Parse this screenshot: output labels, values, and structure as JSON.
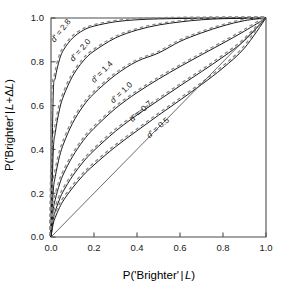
{
  "chart_data": {
    "type": "line",
    "title": "",
    "xlabel": "P('Brighter' | L)",
    "ylabel": "P('Brighter' | L+ΔL)",
    "xlim": [
      0.0,
      1.0
    ],
    "ylim": [
      0.0,
      1.0
    ],
    "grid": false,
    "legend_position": "inline-curve-labels",
    "xticks": [
      "0.0",
      "0.2",
      "0.4",
      "0.6",
      "0.8",
      "1.0"
    ],
    "xtick_values": [
      0.0,
      0.2,
      0.4,
      0.6,
      0.8,
      1.0
    ],
    "yticks": [
      "0.0",
      "0.2",
      "0.4",
      "0.6",
      "0.8",
      "1.0"
    ],
    "ytick_values": [
      0.0,
      0.2,
      0.4,
      0.6,
      0.8,
      1.0
    ],
    "series": [
      {
        "name": "d' = 2.8",
        "dprime": 2.8,
        "label": "d' = 2.8",
        "label_x": 0.055,
        "label_y": 0.935,
        "label_rotation": -52,
        "style": "solid-with-dashed-overlay",
        "x": [
          0.0,
          0.01,
          0.02,
          0.04,
          0.06,
          0.1,
          0.15,
          0.2,
          0.3,
          0.4,
          0.5,
          0.6,
          0.7,
          0.8,
          0.9,
          1.0
        ],
        "y": [
          0.0,
          0.636,
          0.727,
          0.812,
          0.857,
          0.908,
          0.944,
          0.963,
          0.983,
          0.992,
          0.996,
          0.998,
          0.999,
          1.0,
          1.0,
          1.0
        ]
      },
      {
        "name": "d' = 2.0",
        "dprime": 2.0,
        "label": "d' = 2.0",
        "label_x": 0.145,
        "label_y": 0.845,
        "label_rotation": -48,
        "style": "solid-with-dashed-overlay",
        "x": [
          0.0,
          0.01,
          0.02,
          0.04,
          0.06,
          0.1,
          0.15,
          0.2,
          0.3,
          0.4,
          0.5,
          0.6,
          0.7,
          0.8,
          0.9,
          1.0
        ],
        "y": [
          0.0,
          0.379,
          0.477,
          0.584,
          0.648,
          0.734,
          0.804,
          0.849,
          0.909,
          0.945,
          0.968,
          0.982,
          0.992,
          0.997,
          0.999,
          1.0
        ]
      },
      {
        "name": "d' = 1.4",
        "dprime": 1.4,
        "label": "d' = 1.4",
        "label_x": 0.245,
        "label_y": 0.745,
        "label_rotation": -45,
        "style": "solid-with-dashed-overlay",
        "x": [
          0.0,
          0.01,
          0.02,
          0.04,
          0.06,
          0.1,
          0.15,
          0.2,
          0.3,
          0.4,
          0.5,
          0.6,
          0.7,
          0.8,
          0.9,
          1.0
        ],
        "y": [
          0.0,
          0.204,
          0.277,
          0.369,
          0.43,
          0.519,
          0.598,
          0.655,
          0.74,
          0.802,
          0.84,
          0.893,
          0.932,
          0.964,
          0.988,
          1.0
        ]
      },
      {
        "name": "d' = 1.0",
        "dprime": 1.0,
        "label": "d' = 1.0",
        "label_x": 0.335,
        "label_y": 0.65,
        "label_rotation": -43,
        "style": "solid-with-dashed-overlay",
        "x": [
          0.0,
          0.01,
          0.02,
          0.04,
          0.06,
          0.1,
          0.15,
          0.2,
          0.3,
          0.4,
          0.5,
          0.6,
          0.7,
          0.8,
          0.9,
          1.0
        ],
        "y": [
          0.0,
          0.12,
          0.172,
          0.242,
          0.292,
          0.367,
          0.44,
          0.496,
          0.587,
          0.659,
          0.721,
          0.778,
          0.832,
          0.885,
          0.94,
          1.0
        ]
      },
      {
        "name": "d' = 0.7",
        "dprime": 0.7,
        "label": "d' = 0.7",
        "label_x": 0.425,
        "label_y": 0.565,
        "label_rotation": -42,
        "style": "solid-with-dashed-overlay",
        "x": [
          0.0,
          0.01,
          0.02,
          0.04,
          0.06,
          0.1,
          0.15,
          0.2,
          0.3,
          0.4,
          0.5,
          0.6,
          0.7,
          0.8,
          0.9,
          1.0
        ],
        "y": [
          0.0,
          0.079,
          0.118,
          0.173,
          0.214,
          0.278,
          0.343,
          0.395,
          0.483,
          0.557,
          0.624,
          0.69,
          0.755,
          0.822,
          0.897,
          1.0
        ]
      },
      {
        "name": "d' = 0.5",
        "dprime": 0.5,
        "label": "d' = 0.5",
        "label_x": 0.505,
        "label_y": 0.49,
        "label_rotation": -41,
        "style": "solid-with-dashed-overlay",
        "x": [
          0.0,
          0.01,
          0.02,
          0.04,
          0.06,
          0.1,
          0.15,
          0.2,
          0.3,
          0.4,
          0.5,
          0.6,
          0.7,
          0.8,
          0.9,
          1.0
        ],
        "y": [
          0.0,
          0.059,
          0.09,
          0.135,
          0.17,
          0.224,
          0.282,
          0.329,
          0.412,
          0.485,
          0.556,
          0.625,
          0.696,
          0.772,
          0.863,
          1.0
        ]
      },
      {
        "name": "chance-diagonal",
        "dprime": 0.0,
        "label": "",
        "style": "solid-thin",
        "x": [
          0.0,
          1.0
        ],
        "y": [
          0.0,
          1.0
        ]
      }
    ],
    "colors": {
      "axis": "#4d4d4d",
      "curve_solid": "#1a1a1a",
      "curve_dashed": "#8c8c8c",
      "diagonal": "#595959",
      "text": "#1a1a1a",
      "background": "#ffffff"
    }
  },
  "axes": {
    "x_title_parts": {
      "pre": "P('Brighter'",
      "bar": "|",
      "ital": "L",
      "post": ")"
    },
    "y_title_parts": {
      "pre": "P('Brighter'",
      "bar": "|",
      "ital1": "L",
      "plus": "+Δ",
      "ital2": "L",
      "post": ")"
    }
  }
}
